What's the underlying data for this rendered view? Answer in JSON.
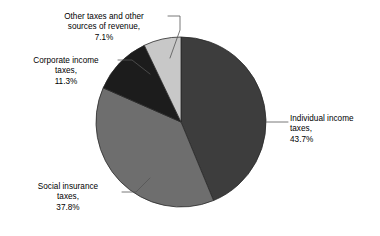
{
  "chart_data": {
    "type": "pie",
    "title": "",
    "subtitle": "",
    "xlabel": "",
    "ylabel": "",
    "grid": false,
    "legend_position": "none",
    "label_style": "outside-with-leader-lines",
    "start_angle_deg": 0,
    "direction": "clockwise",
    "categories": [
      "Individual income taxes",
      "Social insurance taxes",
      "Corporate income taxes",
      "Other taxes and other sources of revenue"
    ],
    "values": [
      43.7,
      37.8,
      11.3,
      7.1
    ],
    "value_unit": "%",
    "total": 99.9,
    "colors": [
      "#3d3d3d",
      "#6e6e6e",
      "#1c1c1c",
      "#c8c8c8"
    ],
    "slices": [
      {
        "name": "Individual income taxes",
        "value": 43.7,
        "value_text": "43.7%",
        "color": "#3d3d3d",
        "start_angle_deg": 0,
        "end_angle_deg": 157.32
      },
      {
        "name": "Social insurance taxes",
        "value": 37.8,
        "value_text": "37.8%",
        "color": "#6e6e6e",
        "start_angle_deg": 157.32,
        "end_angle_deg": 293.4
      },
      {
        "name": "Corporate income taxes",
        "value": 11.3,
        "value_text": "11.3%",
        "color": "#1c1c1c",
        "start_angle_deg": 293.4,
        "end_angle_deg": 334.08
      },
      {
        "name": "Other taxes and other sources of revenue",
        "value": 7.1,
        "value_text": "7.1%",
        "color": "#c8c8c8",
        "start_angle_deg": 334.08,
        "end_angle_deg": 359.64
      }
    ]
  },
  "labels": {
    "individual": {
      "text": "Individual income\ntaxes,\n43.7%",
      "name": "Individual income taxes",
      "percent": "43.7%"
    },
    "social": {
      "text": "Social insurance\ntaxes,\n37.8%",
      "name": "Social insurance taxes",
      "percent": "37.8%"
    },
    "corporate": {
      "text": "Corporate income\ntaxes,\n11.3%",
      "name": "Corporate income taxes",
      "percent": "11.3%"
    },
    "other": {
      "text": "Other taxes and other\nsources of revenue,\n7.1%",
      "name": "Other taxes and other sources of revenue",
      "percent": "7.1%"
    }
  },
  "style": {
    "background": "#ffffff",
    "text_color": "#000000",
    "leader_line_color": "#555555",
    "pie_outline_color": "#2a2a2a"
  }
}
